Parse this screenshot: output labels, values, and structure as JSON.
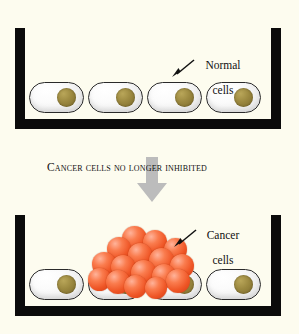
{
  "figure": {
    "background_color": "#fdfcef",
    "width": 299,
    "height": 334
  },
  "colors": {
    "wall": "#0b0b0b",
    "normal_cell_fill": "#fbfbfb",
    "normal_cell_outline": "#2a2a2a",
    "nucleus": "#9c8940",
    "cancer_cell": "#ef5626",
    "cancer_cell_highlight": "#ffb39a",
    "big_arrow": "#b9b9b9",
    "text": "#111111"
  },
  "top_panel": {
    "label": {
      "line1": "Normal",
      "line2": "cells",
      "icon": "pointer-arrow-icon"
    },
    "cells": [
      {
        "name": "normal-cell-1"
      },
      {
        "name": "normal-cell-2"
      },
      {
        "name": "normal-cell-3"
      },
      {
        "name": "normal-cell-4"
      }
    ]
  },
  "middle": {
    "caption": "Cancer cells no longer inhibited",
    "arrow_icon": "down-arrow-icon"
  },
  "bottom_panel": {
    "label": {
      "line1": "Cancer",
      "line2": "cells",
      "icon": "pointer-arrow-icon"
    },
    "cells": [
      {
        "name": "normal-cell-1"
      },
      {
        "name": "normal-cell-2"
      },
      {
        "name": "normal-cell-3"
      },
      {
        "name": "normal-cell-4"
      }
    ],
    "cancer_cluster_count": 16
  }
}
